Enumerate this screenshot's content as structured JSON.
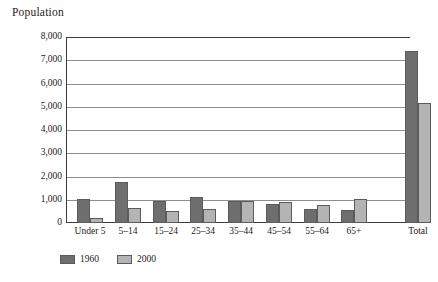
{
  "chart_data": {
    "type": "bar",
    "title": "Population",
    "xlabel": "",
    "ylabel": "",
    "ylim": [
      0,
      8000
    ],
    "yticks": [
      "0",
      "1,000",
      "2,000",
      "3,000",
      "4,000",
      "5,000",
      "6,000",
      "7,000",
      "8,000"
    ],
    "ytick_values": [
      0,
      1000,
      2000,
      3000,
      4000,
      5000,
      6000,
      7000,
      8000
    ],
    "grid": "horizontal",
    "legend_position": "bottom-left",
    "categories": [
      "Under 5",
      "5–14",
      "15–24",
      "25–34",
      "35–44",
      "45–54",
      "55–64",
      "65+",
      "Total"
    ],
    "series": [
      {
        "name": "1960",
        "color": "#6e6e6e",
        "values": [
          1030,
          1750,
          950,
          1100,
          950,
          820,
          620,
          570,
          7380
        ]
      },
      {
        "name": "2000",
        "color": "#b4b4b4",
        "values": [
          215,
          650,
          510,
          600,
          930,
          900,
          760,
          1020,
          5180
        ]
      }
    ]
  },
  "legend": {
    "items": [
      {
        "label": "1960",
        "swatch": "dark-gray-swatch"
      },
      {
        "label": "2000",
        "swatch": "light-gray-swatch"
      }
    ]
  },
  "colors": {
    "series_1960": "#6e6e6e",
    "series_2000": "#b4b4b4",
    "axis": "#3d3d3d",
    "gridline": "#8e8e8e",
    "background": "#ffffff",
    "text": "#1a1a1a"
  }
}
